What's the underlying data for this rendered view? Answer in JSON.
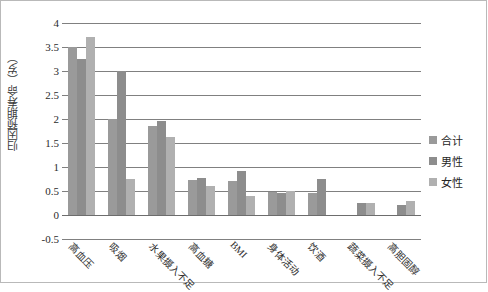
{
  "chart_data": {
    "type": "bar",
    "title": "",
    "xlabel": "",
    "ylabel": "归因预期寿命（岁）",
    "ylim": [
      -0.5,
      4
    ],
    "ytick_step": 0.5,
    "grid": true,
    "legend_position": "right",
    "categories": [
      "高血压",
      "吸烟",
      "水果摄入不足",
      "高血糖",
      "BMI",
      "身体活动",
      "饮酒",
      "蔬菜摄入不足",
      "高胆固醇"
    ],
    "ytick_labels": [
      "4",
      "3.5",
      "3",
      "2.5",
      "2",
      "1.5",
      "1",
      "0.5",
      "0",
      "-0.5"
    ],
    "ytick_values": [
      4,
      3.5,
      3,
      2.5,
      2,
      1.5,
      1,
      0.5,
      0,
      -0.5
    ],
    "series": [
      {
        "name": "合计",
        "color": "#9a9a9a",
        "values": [
          3.5,
          2.0,
          1.85,
          0.72,
          0.7,
          0.48,
          0.45,
          0.0,
          0.0
        ]
      },
      {
        "name": "男性",
        "color": "#8d8d8d",
        "values": [
          3.25,
          3.0,
          1.95,
          0.78,
          0.92,
          0.45,
          0.75,
          0.25,
          0.2
        ]
      },
      {
        "name": "女性",
        "color": "#b0b0b0",
        "values": [
          3.7,
          0.75,
          1.62,
          0.6,
          0.4,
          0.5,
          0.0,
          0.25,
          0.3
        ]
      }
    ]
  },
  "legend": {
    "items": [
      {
        "label": "合计"
      },
      {
        "label": "男性"
      },
      {
        "label": "女性"
      }
    ]
  }
}
